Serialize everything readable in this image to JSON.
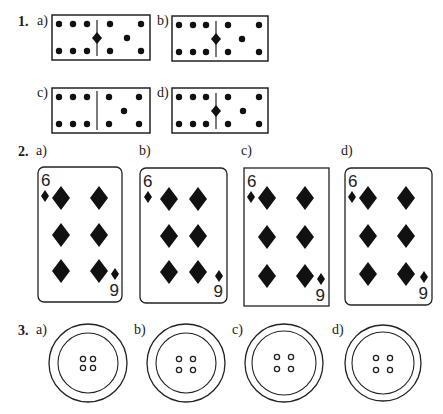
{
  "questions": [
    {
      "number": "1.",
      "type": "dominoes",
      "options": [
        {
          "label": "a)",
          "center_pin": true
        },
        {
          "label": "b)",
          "center_pin": true
        },
        {
          "label": "c)",
          "center_pin": false
        },
        {
          "label": "d)",
          "center_pin": true
        }
      ]
    },
    {
      "number": "2.",
      "type": "playing-cards",
      "options": [
        {
          "label": "a)",
          "top_rank": "6",
          "bottom_rank": "9",
          "suit": "diamond",
          "rounded_corners": true
        },
        {
          "label": "b)",
          "top_rank": "6",
          "bottom_rank": "9",
          "suit": "diamond",
          "rounded_corners": true
        },
        {
          "label": "c)",
          "top_rank": "6",
          "bottom_rank": "9",
          "suit": "diamond",
          "rounded_corners": false
        },
        {
          "label": "d)",
          "top_rank": "6",
          "bottom_rank": "9",
          "suit": "diamond",
          "rounded_corners": true
        }
      ]
    },
    {
      "number": "3.",
      "type": "buttons",
      "options": [
        {
          "label": "a)",
          "holes": 4
        },
        {
          "label": "b)",
          "holes": 4
        },
        {
          "label": "c)",
          "holes": 4
        },
        {
          "label": "d)",
          "holes": 4
        }
      ]
    }
  ]
}
